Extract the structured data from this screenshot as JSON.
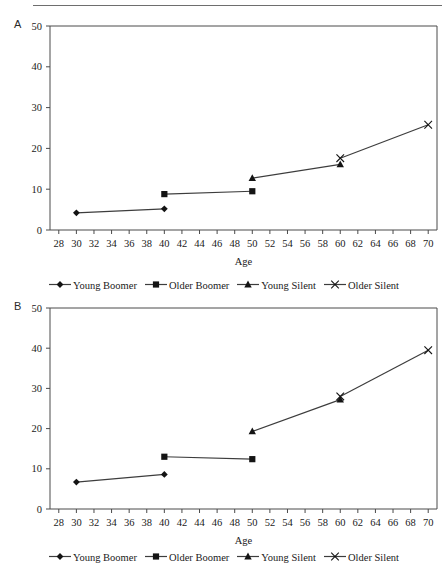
{
  "figure": {
    "rule_present": true,
    "panels": [
      "A",
      "B"
    ]
  },
  "panel_a": {
    "letter": "A",
    "legend": [
      {
        "label": "Young Boomer",
        "marker": "diamond-marker-icon"
      },
      {
        "label": "Older Boomer",
        "marker": "square-marker-icon"
      },
      {
        "label": "Young Silent",
        "marker": "triangle-marker-icon"
      },
      {
        "label": "Older Silent",
        "marker": "cross-marker-icon"
      }
    ]
  },
  "panel_b": {
    "letter": "B",
    "legend": [
      {
        "label": "Young Boomer",
        "marker": "diamond-marker-icon"
      },
      {
        "label": "Older Boomer",
        "marker": "square-marker-icon"
      },
      {
        "label": "Young Silent",
        "marker": "triangle-marker-icon"
      },
      {
        "label": "Older Silent",
        "marker": "cross-marker-icon"
      }
    ]
  },
  "chart_data": [
    {
      "id": "panel-a",
      "type": "line",
      "title": "A",
      "xlabel": "Age",
      "ylabel": "",
      "xlim": [
        27,
        71
      ],
      "ylim": [
        0,
        50
      ],
      "xticks": [
        28,
        30,
        32,
        34,
        36,
        38,
        40,
        42,
        44,
        46,
        48,
        50,
        52,
        54,
        56,
        58,
        60,
        62,
        64,
        66,
        68,
        70
      ],
      "yticks": [
        0,
        10,
        20,
        30,
        40,
        50
      ],
      "grid": false,
      "legend_position": "bottom",
      "series": [
        {
          "name": "Young Boomer",
          "marker": "diamond",
          "x": [
            30,
            40
          ],
          "values": [
            4.2,
            5.2
          ]
        },
        {
          "name": "Older Boomer",
          "marker": "square",
          "x": [
            40,
            50
          ],
          "values": [
            8.8,
            9.5
          ]
        },
        {
          "name": "Young Silent",
          "marker": "triangle",
          "x": [
            50,
            60
          ],
          "values": [
            12.7,
            16.1
          ]
        },
        {
          "name": "Older Silent",
          "marker": "cross",
          "x": [
            60,
            70
          ],
          "values": [
            17.6,
            25.8
          ]
        }
      ]
    },
    {
      "id": "panel-b",
      "type": "line",
      "title": "B",
      "xlabel": "Age",
      "ylabel": "",
      "xlim": [
        27,
        71
      ],
      "ylim": [
        0,
        50
      ],
      "xticks": [
        28,
        30,
        32,
        34,
        36,
        38,
        40,
        42,
        44,
        46,
        48,
        50,
        52,
        54,
        56,
        58,
        60,
        62,
        64,
        66,
        68,
        70
      ],
      "yticks": [
        0,
        10,
        20,
        30,
        40,
        50
      ],
      "grid": false,
      "legend_position": "bottom",
      "series": [
        {
          "name": "Young Boomer",
          "marker": "diamond",
          "x": [
            30,
            40
          ],
          "values": [
            6.7,
            8.6
          ]
        },
        {
          "name": "Older Boomer",
          "marker": "square",
          "x": [
            40,
            50
          ],
          "values": [
            13.0,
            12.4
          ]
        },
        {
          "name": "Young Silent",
          "marker": "triangle",
          "x": [
            50,
            60
          ],
          "values": [
            19.3,
            27.2
          ]
        },
        {
          "name": "Older Silent",
          "marker": "cross",
          "x": [
            60,
            70
          ],
          "values": [
            28.0,
            39.5
          ]
        }
      ]
    }
  ]
}
